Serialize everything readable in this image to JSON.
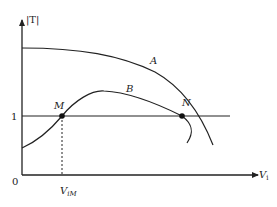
{
  "diagram": {
    "title": "",
    "y_axis_label": "|T|",
    "x_axis_label": "V",
    "x_axis_label_sub": "i",
    "origin_label": "0",
    "unity_label": "1",
    "curves": [
      {
        "name": "A",
        "label": "A"
      },
      {
        "name": "B",
        "label": "B"
      }
    ],
    "points": [
      {
        "name": "M",
        "label": "M"
      },
      {
        "name": "N",
        "label": "N"
      }
    ],
    "marker_label": "V",
    "marker_label_sub": "iM"
  },
  "colors": {
    "stroke": "#222222",
    "text": "#222222",
    "background": "#ffffff"
  }
}
